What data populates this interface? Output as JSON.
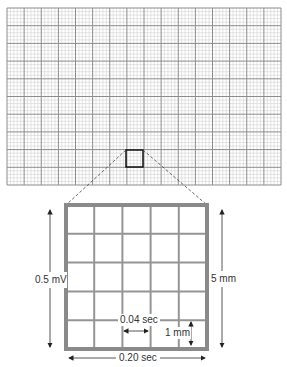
{
  "diagram": {
    "paper_grid": {
      "left": 7,
      "top": 8,
      "right": 281,
      "bottom": 185,
      "major_cols": 16,
      "major_rows": 10,
      "minor_per_major": 5,
      "major_color": "#8c8c8c",
      "minor_color": "#d2d2d2"
    },
    "highlight_box": {
      "left": 126,
      "top": 150,
      "right": 143,
      "bottom": 167,
      "color": "#111111"
    },
    "magnified_box": {
      "left": 66,
      "top": 205,
      "right": 207,
      "bottom": 349,
      "cells": 5,
      "border_color": "#8a8a8a",
      "line_color": "#959595"
    },
    "labels": {
      "voltage": "0.5 mV",
      "height": "5 mm",
      "small_time": "0.04 sec",
      "small_height": "1 mm",
      "large_time": "0.20 sec"
    }
  }
}
